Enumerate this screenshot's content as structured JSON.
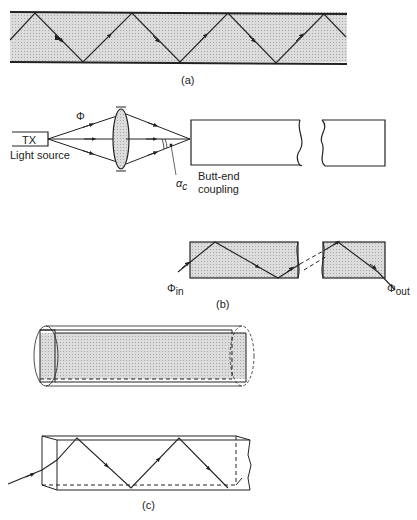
{
  "figure": {
    "panel_a": {
      "caption": "(a)"
    },
    "panel_b": {
      "caption": "(b)",
      "tx_label": "TX",
      "light_source_label": "Light source",
      "phi_label": "Φ",
      "alpha_label": "α",
      "alpha_sub": "c",
      "butt_end_line1": "Butt-end",
      "butt_end_line2": "coupling",
      "phi_in": "Φ",
      "phi_in_sub": "in",
      "phi_out": "Φ",
      "phi_out_sub": "out"
    },
    "panel_c": {
      "caption": "(c)"
    }
  },
  "colors": {
    "line": "#222222",
    "shade": "#d6d6d6",
    "background": "#ffffff"
  }
}
